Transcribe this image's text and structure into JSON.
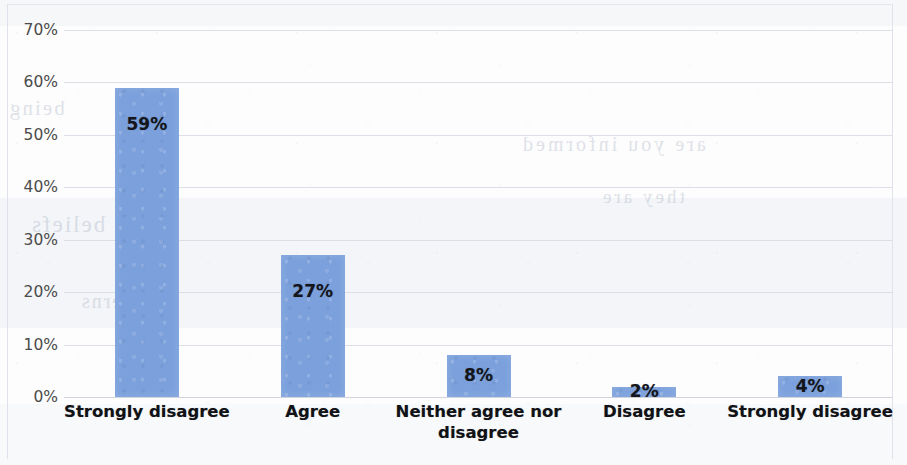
{
  "chart_data": {
    "type": "bar",
    "title": "",
    "xlabel": "",
    "ylabel": "",
    "categories": [
      "Strongly disagree",
      "Agree",
      "Neither agree nor disagree",
      "Disagree",
      "Strongly disagree"
    ],
    "values": [
      59,
      27,
      8,
      2,
      4
    ],
    "data_labels": [
      "59%",
      "27%",
      "8%",
      "2%",
      "4%"
    ],
    "ylim": [
      0,
      70
    ],
    "ytick_values": [
      70,
      60,
      50,
      40,
      30,
      20,
      10,
      0
    ],
    "ytick_labels": [
      "70%",
      "60%",
      "50%",
      "40%",
      "30%",
      "20%",
      "10%",
      "0%"
    ],
    "grid": true,
    "legend": false,
    "legend_position": "none",
    "series_color": "#7ba0dc",
    "gridline_color": "#d6d9e2",
    "label_color": "#101216"
  },
  "scan_artifacts": {
    "ghost_text": [
      "being",
      "are you informed",
      "beliefs",
      "concerns",
      "they are"
    ]
  }
}
